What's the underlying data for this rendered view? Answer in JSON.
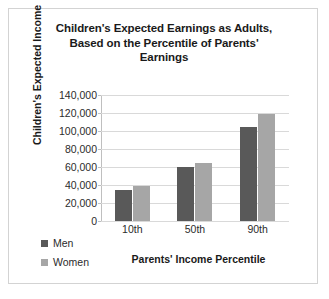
{
  "chart_data": {
    "type": "bar",
    "title": "Children's Expected Earnings as Adults, Based on the Percentile of Parents' Earnings",
    "title_lines": [
      "Children's Expected Earnings as Adults,",
      "Based on the Percentile of Parents'",
      "Earnings"
    ],
    "categories": [
      "10th",
      "50th",
      "90th"
    ],
    "series": [
      {
        "name": "Men",
        "values": [
          35000,
          60000,
          105000
        ],
        "color": "#595959"
      },
      {
        "name": "Women",
        "values": [
          39000,
          65000,
          119000
        ],
        "color": "#a6a6a6"
      }
    ],
    "xlabel": "Parents' Income Percentile",
    "ylabel": "Children's Expected Income",
    "ylim": [
      0,
      140000
    ],
    "ytick_values": [
      0,
      20000,
      40000,
      60000,
      80000,
      100000,
      120000,
      140000
    ],
    "ytick_labels": [
      "0",
      "20,000",
      "40,000",
      "60,000",
      "80,000",
      "100,000",
      "120,000",
      "140,000"
    ],
    "grid": true,
    "legend_position": "bottom-left-outside"
  }
}
